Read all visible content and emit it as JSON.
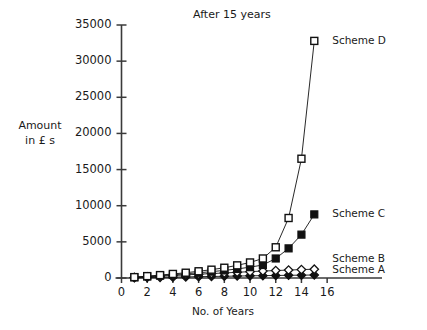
{
  "chart_data": {
    "type": "line",
    "title": "After 15 years",
    "xlabel": "No. of Years",
    "ylabel": "Amount in £ s",
    "ylabel_line1": "Amount",
    "ylabel_line2": "in £ s",
    "xlim": [
      0,
      17
    ],
    "ylim": [
      0,
      35000
    ],
    "xticks": [
      0,
      2,
      4,
      6,
      8,
      10,
      12,
      14,
      16
    ],
    "xtick_labels": [
      "0",
      "2",
      "4",
      "6",
      "8",
      "10",
      "12",
      "14",
      "16"
    ],
    "yticks": [
      0,
      5000,
      10000,
      15000,
      20000,
      25000,
      30000,
      35000
    ],
    "ytick_labels": [
      "0",
      "5000",
      "10000",
      "15000",
      "20000",
      "25000",
      "30000",
      "35000"
    ],
    "grid": false,
    "legend_position": "right-inline",
    "x": [
      1,
      2,
      3,
      4,
      5,
      6,
      7,
      8,
      9,
      10,
      11,
      12,
      13,
      14,
      15
    ],
    "series": [
      {
        "name": "Scheme D",
        "label": "Scheme D",
        "marker": "open-square",
        "color": "#111111",
        "values": [
          120,
          260,
          400,
          560,
          730,
          930,
          1150,
          1420,
          1750,
          2150,
          2700,
          4250,
          8300,
          16500,
          32800
        ]
      },
      {
        "name": "Scheme C",
        "label": "Scheme C",
        "marker": "filled-square",
        "color": "#111111",
        "values": [
          100,
          210,
          330,
          450,
          580,
          720,
          880,
          1050,
          1250,
          1500,
          1800,
          2700,
          4100,
          6000,
          8800
        ]
      },
      {
        "name": "Scheme B",
        "label": "Scheme B",
        "marker": "open-diamond",
        "color": "#111111",
        "values": [
          80,
          165,
          250,
          340,
          430,
          520,
          610,
          700,
          790,
          880,
          960,
          1030,
          1100,
          1160,
          1220
        ]
      },
      {
        "name": "Scheme A",
        "label": "Scheme A",
        "marker": "filled-diamond",
        "color": "#111111",
        "values": [
          30,
          60,
          90,
          120,
          150,
          180,
          210,
          240,
          270,
          300,
          325,
          350,
          375,
          395,
          415
        ]
      }
    ]
  },
  "axes": {
    "y_axis_name": "y-axis",
    "x_axis_name": "x-axis"
  },
  "caption": {
    "text": ""
  }
}
